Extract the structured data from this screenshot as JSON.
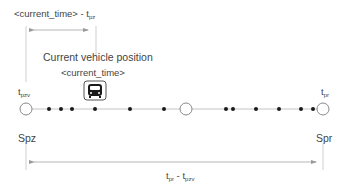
{
  "top_interval": {
    "label_main": "<current_time> - t",
    "label_sub": "pz"
  },
  "vehicle": {
    "position_label": "Current vehicle position",
    "time_label": "<current_time>",
    "icon": "bus-icon"
  },
  "start_stop": {
    "time_main": "t",
    "time_sub": "pzv",
    "name": "Spz"
  },
  "end_stop": {
    "time_main": "t",
    "time_sub": "pr",
    "name": "Spr"
  },
  "bottom_interval": {
    "label_a_main": "t",
    "label_a_sub": "pr",
    "separator": " - ",
    "label_b_main": "t",
    "label_b_sub": "pzv"
  },
  "route": {
    "stop_circles_x": [
      26,
      186,
      323
    ],
    "point_dots_x": [
      49,
      61,
      72,
      95,
      130,
      164,
      226,
      233,
      256,
      279,
      301,
      313
    ],
    "line_y": 109
  },
  "colors": {
    "line": "#b5b5b5",
    "text": "#444444",
    "dot": "#1a1a1a",
    "circle_stroke": "#8a8a8a"
  }
}
